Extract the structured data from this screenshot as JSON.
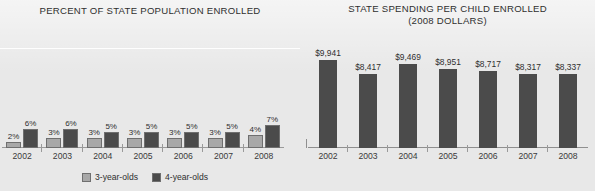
{
  "left": {
    "title": "PERCENT OF STATE POPULATION ENROLLED",
    "legend": {
      "series3": "3-year-olds",
      "series4": "4-year-olds"
    }
  },
  "right": {
    "title_line1": "STATE SPENDING PER CHILD ENROLLED",
    "title_line2": "(2008 DOLLARS)"
  },
  "colors": {
    "three_year_olds": "#a8a8a8",
    "four_year_olds": "#4b4b4b",
    "spending_bar": "#4b4b4b",
    "axis": "#9a9a9a",
    "background": "#e8e8e8",
    "text": "#2f2f2f"
  },
  "chart_data": [
    {
      "type": "bar",
      "title": "PERCENT OF STATE POPULATION ENROLLED",
      "xlabel": "",
      "ylabel": "",
      "ylim": [
        0,
        8
      ],
      "grid": false,
      "legend_position": "bottom",
      "categories": [
        "2002",
        "2003",
        "2004",
        "2005",
        "2006",
        "2007",
        "2008"
      ],
      "series": [
        {
          "name": "3-year-olds",
          "color": "#a8a8a8",
          "values": [
            2,
            3,
            3,
            3,
            3,
            3,
            4
          ],
          "labels": [
            "2%",
            "3%",
            "3%",
            "3%",
            "3%",
            "3%",
            "4%"
          ]
        },
        {
          "name": "4-year-olds",
          "color": "#4b4b4b",
          "values": [
            6,
            6,
            5,
            5,
            5,
            5,
            7
          ],
          "labels": [
            "6%",
            "6%",
            "5%",
            "5%",
            "5%",
            "5%",
            "7%"
          ]
        }
      ]
    },
    {
      "type": "bar",
      "title": "STATE SPENDING PER CHILD ENROLLED (2008 DOLLARS)",
      "xlabel": "",
      "ylabel": "",
      "ylim": [
        0,
        10000
      ],
      "grid": false,
      "legend_position": "none",
      "categories": [
        "2002",
        "2003",
        "2004",
        "2005",
        "2006",
        "2007",
        "2008"
      ],
      "values": [
        9941,
        8417,
        9469,
        8951,
        8717,
        8317,
        8337
      ],
      "labels": [
        "$9,941",
        "$8,417",
        "$9,469",
        "$8,951",
        "$8,717",
        "$8,317",
        "$8,337"
      ],
      "series": [
        {
          "name": "State spending per child enrolled",
          "color": "#4b4b4b",
          "values": [
            9941,
            8417,
            9469,
            8951,
            8717,
            8317,
            8337
          ]
        }
      ]
    }
  ]
}
